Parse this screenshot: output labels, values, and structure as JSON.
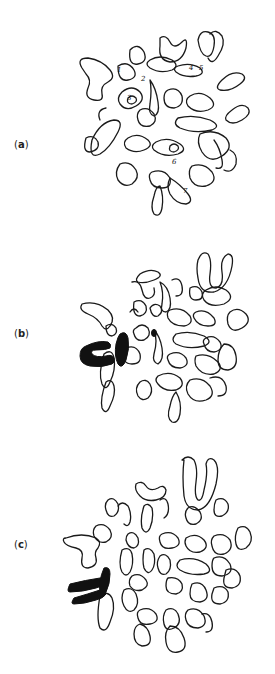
{
  "figure": {
    "panels": [
      {
        "id": "a",
        "label_open": "(",
        "label_letter": "a",
        "label_close": ")",
        "numbered_chromosomes": [
          "1",
          "2",
          "3",
          "4",
          "5",
          "6",
          "7"
        ]
      },
      {
        "id": "b",
        "label_open": "(",
        "label_letter": "b",
        "label_close": ")"
      },
      {
        "id": "c",
        "label_open": "(",
        "label_letter": "c",
        "label_close": ")"
      }
    ],
    "colors": {
      "ink": "#1a1a1a",
      "background": "#ffffff"
    }
  }
}
